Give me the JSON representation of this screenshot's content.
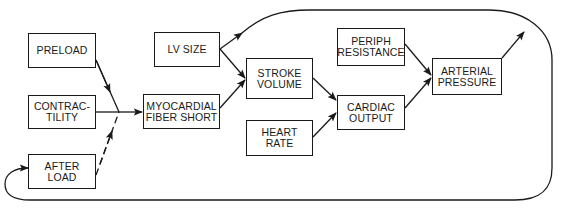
{
  "diagram": {
    "line_color": "#1a1a1a",
    "nodes": {
      "preload": {
        "lines": [
          "PRELOAD"
        ]
      },
      "contractility": {
        "lines": [
          "CONTRAC-",
          "TILITY"
        ]
      },
      "afterload": {
        "lines": [
          "AFTER",
          "LOAD"
        ]
      },
      "lv_size": {
        "lines": [
          "LV SIZE"
        ]
      },
      "myocardial": {
        "lines": [
          "MYOCARDIAL",
          "FIBER SHORT"
        ]
      },
      "stroke_volume": {
        "lines": [
          "STROKE",
          "VOLUME"
        ]
      },
      "heart_rate": {
        "lines": [
          "HEART",
          "RATE"
        ]
      },
      "periph_resistance": {
        "lines": [
          "PERIPH",
          "RESISTANCE"
        ]
      },
      "cardiac_output": {
        "lines": [
          "CARDIAC",
          "OUTPUT"
        ]
      },
      "arterial_pressure": {
        "lines": [
          "ARTERIAL",
          "PRESSURE"
        ]
      }
    },
    "edges": [
      {
        "from": "PRELOAD",
        "to": "junction",
        "style": "solid"
      },
      {
        "from": "CONTRACTILITY",
        "to": "junction",
        "style": "solid"
      },
      {
        "from": "AFTER LOAD",
        "to": "junction",
        "style": "dashed"
      },
      {
        "from": "junction",
        "to": "MYOCARDIAL FIBER SHORT",
        "style": "solid"
      },
      {
        "from": "LV SIZE",
        "to": "STROKE VOLUME",
        "style": "solid"
      },
      {
        "from": "MYOCARDIAL FIBER SHORT",
        "to": "STROKE VOLUME",
        "style": "solid"
      },
      {
        "from": "STROKE VOLUME",
        "to": "CARDIAC OUTPUT",
        "style": "solid"
      },
      {
        "from": "HEART RATE",
        "to": "CARDIAC OUTPUT",
        "style": "solid"
      },
      {
        "from": "PERIPH RESISTANCE",
        "to": "ARTERIAL PRESSURE",
        "style": "solid"
      },
      {
        "from": "CARDIAC OUTPUT",
        "to": "ARTERIAL PRESSURE",
        "style": "solid"
      },
      {
        "from": "LV SIZE",
        "to": "feedback loop",
        "style": "solid"
      },
      {
        "from": "ARTERIAL PRESSURE",
        "to": "feedback loop",
        "style": "solid"
      },
      {
        "from": "feedback loop",
        "to": "AFTER LOAD",
        "style": "solid"
      }
    ]
  }
}
